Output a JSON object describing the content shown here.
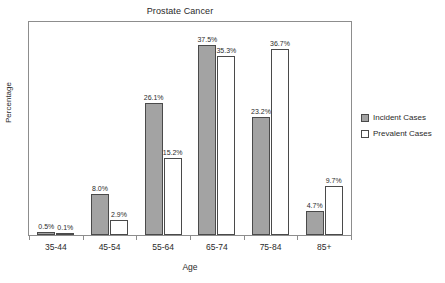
{
  "chart_data": {
    "type": "bar",
    "title": "Prostate Cancer",
    "xlabel": "Age",
    "ylabel": "Percentage",
    "categories": [
      "35-44",
      "45-54",
      "55-64",
      "65-74",
      "75-84",
      "85+"
    ],
    "series": [
      {
        "name": "Incident Cases",
        "color": "#a3a3a3",
        "values": [
          0.5,
          8.0,
          26.1,
          37.5,
          23.2,
          4.7
        ],
        "labels": [
          "0.5%",
          "8.0%",
          "26.1%",
          "37.5%",
          "23.2%",
          "4.7%"
        ]
      },
      {
        "name": "Prevalent Cases",
        "color": "#ffffff",
        "values": [
          0.1,
          2.9,
          15.2,
          35.3,
          36.7,
          9.7
        ],
        "labels": [
          "0.1%",
          "2.9%",
          "15.2%",
          "35.3%",
          "36.7%",
          "9.7%"
        ]
      }
    ],
    "ylim": [
      0,
      42
    ],
    "grid": false,
    "y_tick_labels": [],
    "legend_position": "right"
  }
}
